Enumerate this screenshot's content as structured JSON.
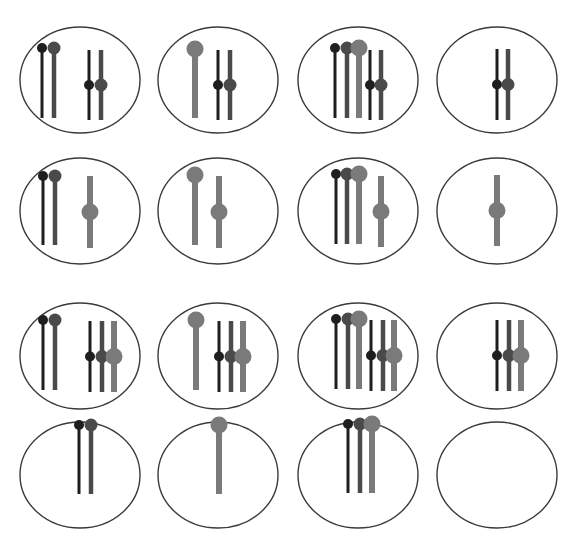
{
  "figure": {
    "title": "",
    "colors": {
      "ellipse_stroke": "#3a3a3a",
      "black": "#1e1e1e",
      "dark": "#4a4a4a",
      "light": "#7a7a7a"
    },
    "chromosome_styles": {
      "black": {
        "width": 3,
        "head_r": 5
      },
      "dark": {
        "width": 4.5,
        "head_r": 6.5
      },
      "light": {
        "width": 6,
        "head_r": 8.5
      }
    },
    "ellipse": {
      "rx": 60,
      "ry": 53
    },
    "cells": [
      {
        "id": "r1c1",
        "cx": 80,
        "cy": 80,
        "chromosomes": [
          {
            "x": 42,
            "type": "acro",
            "shade": "black",
            "top": 48,
            "bottom": 118
          },
          {
            "x": 54,
            "type": "acro",
            "shade": "dark",
            "top": 48,
            "bottom": 118
          },
          {
            "x": 89,
            "type": "meta",
            "shade": "black",
            "top": 50,
            "bottom": 120
          },
          {
            "x": 101,
            "type": "meta",
            "shade": "dark",
            "top": 50,
            "bottom": 120
          }
        ]
      },
      {
        "id": "r1c2",
        "cx": 218,
        "cy": 80,
        "chromosomes": [
          {
            "x": 195,
            "type": "acro",
            "shade": "light",
            "top": 49,
            "bottom": 118
          },
          {
            "x": 218,
            "type": "meta",
            "shade": "black",
            "top": 50,
            "bottom": 120
          },
          {
            "x": 230,
            "type": "meta",
            "shade": "dark",
            "top": 50,
            "bottom": 120
          }
        ]
      },
      {
        "id": "r1c3",
        "cx": 358,
        "cy": 80,
        "chromosomes": [
          {
            "x": 335,
            "type": "acro",
            "shade": "black",
            "top": 48,
            "bottom": 118
          },
          {
            "x": 347,
            "type": "acro",
            "shade": "dark",
            "top": 48,
            "bottom": 118
          },
          {
            "x": 359,
            "type": "acro",
            "shade": "light",
            "top": 48,
            "bottom": 118
          },
          {
            "x": 370,
            "type": "meta",
            "shade": "black",
            "top": 50,
            "bottom": 120
          },
          {
            "x": 381,
            "type": "meta",
            "shade": "dark",
            "top": 50,
            "bottom": 120
          }
        ]
      },
      {
        "id": "r1c4",
        "cx": 497,
        "cy": 80,
        "chromosomes": [
          {
            "x": 497,
            "type": "meta",
            "shade": "black",
            "top": 49,
            "bottom": 120
          },
          {
            "x": 508,
            "type": "meta",
            "shade": "dark",
            "top": 49,
            "bottom": 120
          }
        ]
      },
      {
        "id": "r2c1",
        "cx": 80,
        "cy": 211,
        "chromosomes": [
          {
            "x": 43,
            "type": "acro",
            "shade": "black",
            "top": 176,
            "bottom": 245
          },
          {
            "x": 55,
            "type": "acro",
            "shade": "dark",
            "top": 176,
            "bottom": 245
          },
          {
            "x": 90,
            "type": "meta",
            "shade": "light",
            "top": 176,
            "bottom": 248
          }
        ]
      },
      {
        "id": "r2c2",
        "cx": 218,
        "cy": 211,
        "chromosomes": [
          {
            "x": 195,
            "type": "acro",
            "shade": "light",
            "top": 175,
            "bottom": 245
          },
          {
            "x": 219,
            "type": "meta",
            "shade": "light",
            "top": 176,
            "bottom": 248
          }
        ]
      },
      {
        "id": "r2c3",
        "cx": 358,
        "cy": 211,
        "chromosomes": [
          {
            "x": 336,
            "type": "acro",
            "shade": "black",
            "top": 174,
            "bottom": 244
          },
          {
            "x": 347,
            "type": "acro",
            "shade": "dark",
            "top": 174,
            "bottom": 244
          },
          {
            "x": 359,
            "type": "acro",
            "shade": "light",
            "top": 174,
            "bottom": 244
          },
          {
            "x": 381,
            "type": "meta",
            "shade": "light",
            "top": 176,
            "bottom": 247
          }
        ]
      },
      {
        "id": "r2c4",
        "cx": 497,
        "cy": 211,
        "chromosomes": [
          {
            "x": 497,
            "type": "meta",
            "shade": "light",
            "top": 175,
            "bottom": 246
          }
        ]
      },
      {
        "id": "r3c1",
        "cx": 80,
        "cy": 356,
        "chromosomes": [
          {
            "x": 43,
            "type": "acro",
            "shade": "black",
            "top": 320,
            "bottom": 390
          },
          {
            "x": 55,
            "type": "acro",
            "shade": "dark",
            "top": 320,
            "bottom": 390
          },
          {
            "x": 90,
            "type": "meta",
            "shade": "black",
            "top": 321,
            "bottom": 392
          },
          {
            "x": 102,
            "type": "meta",
            "shade": "dark",
            "top": 321,
            "bottom": 392
          },
          {
            "x": 114,
            "type": "meta",
            "shade": "light",
            "top": 321,
            "bottom": 392
          }
        ]
      },
      {
        "id": "r3c2",
        "cx": 218,
        "cy": 356,
        "chromosomes": [
          {
            "x": 196,
            "type": "acro",
            "shade": "light",
            "top": 320,
            "bottom": 390
          },
          {
            "x": 219,
            "type": "meta",
            "shade": "black",
            "top": 321,
            "bottom": 392
          },
          {
            "x": 231,
            "type": "meta",
            "shade": "dark",
            "top": 321,
            "bottom": 392
          },
          {
            "x": 243,
            "type": "meta",
            "shade": "light",
            "top": 321,
            "bottom": 392
          }
        ]
      },
      {
        "id": "r3c3",
        "cx": 358,
        "cy": 356,
        "chromosomes": [
          {
            "x": 336,
            "type": "acro",
            "shade": "black",
            "top": 319,
            "bottom": 389
          },
          {
            "x": 348,
            "type": "acro",
            "shade": "dark",
            "top": 319,
            "bottom": 389
          },
          {
            "x": 359,
            "type": "acro",
            "shade": "light",
            "top": 319,
            "bottom": 389
          },
          {
            "x": 371,
            "type": "meta",
            "shade": "black",
            "top": 320,
            "bottom": 391
          },
          {
            "x": 383,
            "type": "meta",
            "shade": "dark",
            "top": 320,
            "bottom": 391
          },
          {
            "x": 394,
            "type": "meta",
            "shade": "light",
            "top": 320,
            "bottom": 391
          }
        ]
      },
      {
        "id": "r3c4",
        "cx": 497,
        "cy": 356,
        "chromosomes": [
          {
            "x": 497,
            "type": "meta",
            "shade": "black",
            "top": 320,
            "bottom": 391
          },
          {
            "x": 509,
            "type": "meta",
            "shade": "dark",
            "top": 320,
            "bottom": 391
          },
          {
            "x": 521,
            "type": "meta",
            "shade": "light",
            "top": 320,
            "bottom": 391
          }
        ]
      },
      {
        "id": "r4c1",
        "cx": 80,
        "cy": 475,
        "chromosomes": [
          {
            "x": 79,
            "type": "acro",
            "shade": "black",
            "top": 425,
            "bottom": 494
          },
          {
            "x": 91,
            "type": "acro",
            "shade": "dark",
            "top": 425,
            "bottom": 494
          }
        ]
      },
      {
        "id": "r4c2",
        "cx": 218,
        "cy": 475,
        "chromosomes": [
          {
            "x": 219,
            "type": "acro",
            "shade": "light",
            "top": 425,
            "bottom": 494
          }
        ]
      },
      {
        "id": "r4c3",
        "cx": 358,
        "cy": 475,
        "chromosomes": [
          {
            "x": 348,
            "type": "acro",
            "shade": "black",
            "top": 424,
            "bottom": 493
          },
          {
            "x": 360,
            "type": "acro",
            "shade": "dark",
            "top": 424,
            "bottom": 493
          },
          {
            "x": 372,
            "type": "acro",
            "shade": "light",
            "top": 424,
            "bottom": 493
          }
        ]
      },
      {
        "id": "r4c4",
        "cx": 497,
        "cy": 475,
        "chromosomes": []
      }
    ]
  }
}
